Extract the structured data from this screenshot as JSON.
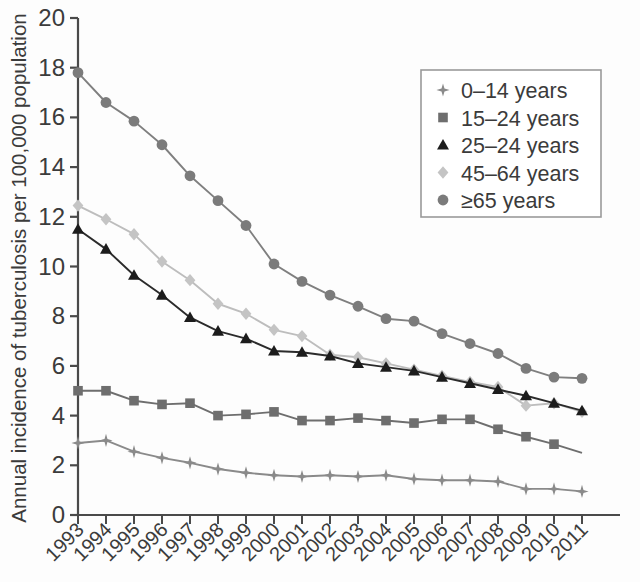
{
  "chart_data": {
    "type": "line",
    "title": "",
    "xlabel": "",
    "ylabel": "Annual incidence of tuberculosis per 100,000 population",
    "x": [
      1993,
      1994,
      1995,
      1996,
      1997,
      1998,
      1999,
      2000,
      2001,
      2002,
      2003,
      2004,
      2005,
      2006,
      2007,
      2008,
      2009,
      2010,
      2011
    ],
    "xtick_labels": [
      "1993",
      "1994",
      "1995",
      "1996",
      "1997",
      "1998",
      "1999",
      "2000",
      "2001",
      "2002",
      "2003",
      "2004",
      "2005",
      "2006",
      "2007",
      "2008",
      "2009",
      "2010",
      "2011"
    ],
    "ytick_labels": [
      "0",
      "2",
      "4",
      "6",
      "8",
      "10",
      "12",
      "14",
      "16",
      "18",
      "20"
    ],
    "ytick_values": [
      0,
      2,
      4,
      6,
      8,
      10,
      12,
      14,
      16,
      18,
      20
    ],
    "ylim": [
      0,
      20
    ],
    "xlim": [
      1993,
      2011
    ],
    "grid": false,
    "legend_position": "upper right",
    "series": [
      {
        "name": "0–14 years",
        "marker": "star-4point",
        "color": "#8a8a8a",
        "line_color": "#8a8a8a",
        "values": [
          2.9,
          3.0,
          2.55,
          2.3,
          2.1,
          1.85,
          1.7,
          1.6,
          1.55,
          1.6,
          1.55,
          1.6,
          1.45,
          1.4,
          1.4,
          1.35,
          1.05,
          1.05,
          0.95
        ]
      },
      {
        "name": "15–24 years",
        "marker": "square",
        "color": "#6e6e6e",
        "line_color": "#6e6e6e",
        "values": [
          5.0,
          5.0,
          4.6,
          4.45,
          4.5,
          4.0,
          4.05,
          4.15,
          3.8,
          3.8,
          3.9,
          3.8,
          3.7,
          3.85,
          3.85,
          3.45,
          3.15,
          2.85,
          2.5
        ]
      },
      {
        "name": "25–24 years",
        "marker": "triangle",
        "color": "#1c1c1c",
        "line_color": "#2b2b2b",
        "values": [
          11.5,
          10.7,
          9.65,
          8.85,
          7.95,
          7.4,
          7.1,
          6.6,
          6.55,
          6.4,
          6.1,
          5.95,
          5.8,
          5.55,
          5.3,
          5.05,
          4.8,
          4.5,
          4.2
        ]
      },
      {
        "name": "45–64 years",
        "marker": "diamond",
        "color": "#c4c4c4",
        "line_color": "#bdbdbd",
        "values": [
          12.45,
          11.9,
          11.3,
          10.2,
          9.45,
          8.5,
          8.1,
          7.45,
          7.2,
          6.45,
          6.35,
          6.1,
          5.85,
          5.6,
          5.35,
          5.15,
          4.4,
          4.5,
          4.15
        ]
      },
      {
        "name": "≥65 years",
        "marker": "circle",
        "color": "#7b7b7b",
        "line_color": "#7f7f7f",
        "values": [
          17.8,
          16.6,
          15.85,
          14.9,
          13.65,
          12.65,
          11.65,
          10.1,
          9.4,
          8.85,
          8.4,
          7.9,
          7.8,
          7.3,
          6.9,
          6.5,
          5.9,
          5.55,
          5.5
        ]
      }
    ]
  },
  "legend": {
    "entries": [
      {
        "label": "0–14 years"
      },
      {
        "label": "15–24 years"
      },
      {
        "label": "25–24 years"
      },
      {
        "label": "45–64 years"
      },
      {
        "label": "≥65 years"
      }
    ]
  },
  "axes": {
    "y_axis_title": "Annual incidence of tuberculosis per 100,000 population"
  },
  "colors": {
    "axis": "#4a4a4a",
    "text": "#3b3b3b",
    "legend_border": "#9a9a9a",
    "background": "#fdfdfd"
  }
}
